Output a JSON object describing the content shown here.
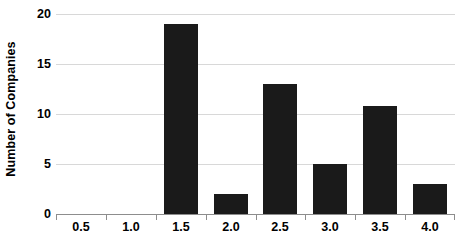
{
  "chart_data": {
    "type": "bar",
    "title": "",
    "subtitle": "",
    "xlabel": "",
    "ylabel": "Number of Companies",
    "categories": [
      "0.5",
      "1.0",
      "1.5",
      "2.0",
      "2.5",
      "3.0",
      "3.5",
      "4.0"
    ],
    "values": [
      0,
      0,
      19,
      2,
      13,
      5,
      10.8,
      3
    ],
    "ylim": [
      0,
      20
    ],
    "y_ticks": [
      0,
      5,
      10,
      15,
      20
    ],
    "y_tick_labels": [
      "0",
      "5",
      "10",
      "15",
      "20"
    ],
    "x_tick_labels": [
      "0.5",
      "1.0",
      "1.5",
      "2.0",
      "2.5",
      "3.0",
      "3.5",
      "4.0"
    ],
    "grid": "horizontal",
    "legend": "none",
    "bar_color": "#1a1a1a",
    "gridline_color": "#d8d8d8",
    "axis_color": "#8d8d8d",
    "background_color": "#ffffff"
  }
}
